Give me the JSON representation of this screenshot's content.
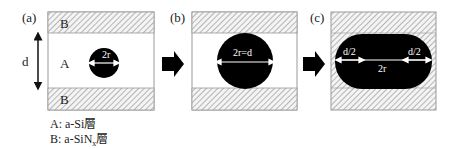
{
  "panels": {
    "a": {
      "label": "(a)",
      "top_layer": "B",
      "middle_layer": "A",
      "bottom_layer": "B",
      "dimension": "d",
      "circle_label": "2r"
    },
    "b": {
      "label": "(b)",
      "circle_label": "2r=d"
    },
    "c": {
      "label": "(c)",
      "left_label": "d/2",
      "right_label": "d/2",
      "center_label": "2r"
    }
  },
  "legend": {
    "a": "A: a-Si層",
    "b_prefix": "B: a-SiN",
    "b_sub": "x",
    "b_suffix": "層"
  },
  "colors": {
    "hatch": "#888888",
    "fill": "#000000",
    "border": "#999999"
  }
}
